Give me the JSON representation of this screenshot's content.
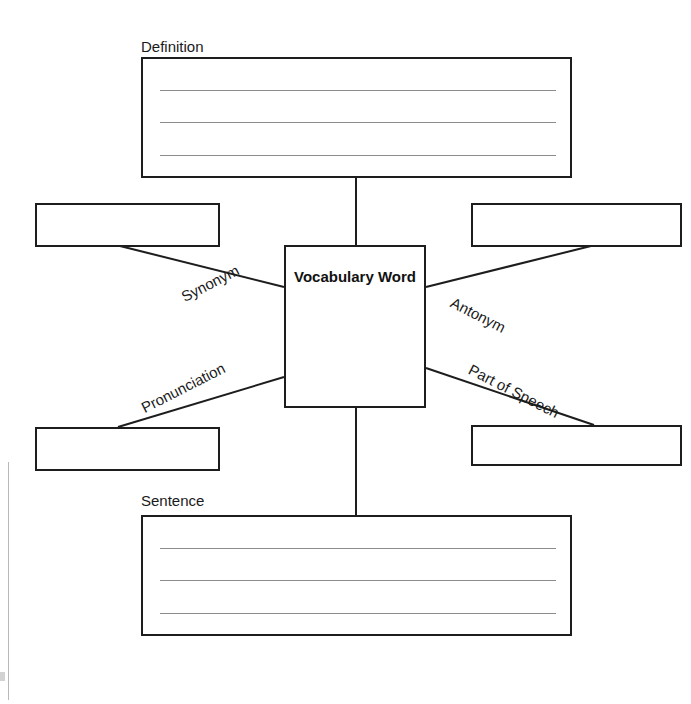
{
  "worksheet": {
    "center": {
      "label": "Vocabulary Word"
    },
    "captions": {
      "definition": "Definition",
      "sentence": "Sentence"
    },
    "branch_labels": {
      "synonym": "Synonym",
      "antonym": "Antonym",
      "pronunciation": "Pronunciation",
      "part_of_speech": "Part of Speech"
    },
    "answer_boxes": {
      "definition_value": "",
      "synonym_value": "",
      "antonym_value": "",
      "pronunciation_value": "",
      "part_of_speech_value": "",
      "sentence_value": ""
    },
    "colors": {
      "ink": "#1d1d1d",
      "rule_line": "#8c8c8c",
      "page": "#ffffff"
    }
  }
}
